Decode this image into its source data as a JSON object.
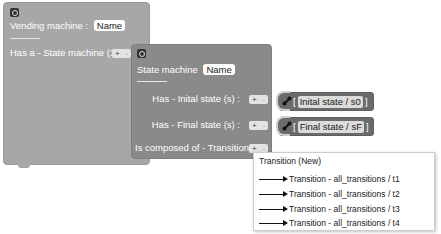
{
  "outer_block": {
    "title": "Vending machine",
    "name_field": "Name",
    "relation_label": "Has a - State machine (1) :",
    "plus": "+",
    "minus": "-"
  },
  "inner_block": {
    "title": "State machine",
    "name_field": "Name",
    "rows": [
      {
        "label": "Has - Inital state (s) :",
        "plus": "+",
        "minus": "-"
      },
      {
        "label": "Has - Final state (s) :",
        "plus": "+",
        "minus": "-"
      },
      {
        "label": "Is composed of - Transition (s) :",
        "plus": "+",
        "minus": "-"
      }
    ]
  },
  "references": [
    {
      "open": "[",
      "value": "Inital state / s0",
      "close": "]"
    },
    {
      "open": "[",
      "value": "Final state / sF",
      "close": "]"
    }
  ],
  "dropdown": {
    "header": "Transition (New)",
    "items": [
      "Transition - all_transitions / t1",
      "Transition - all_transitions / t2",
      "Transition - all_transitions / t3",
      "Transition - all_transitions / t4"
    ]
  },
  "colors": {
    "outer_block": "#a7a7a7",
    "inner_block": "#8a8a8a",
    "reference_block": "#6b6b6b"
  }
}
